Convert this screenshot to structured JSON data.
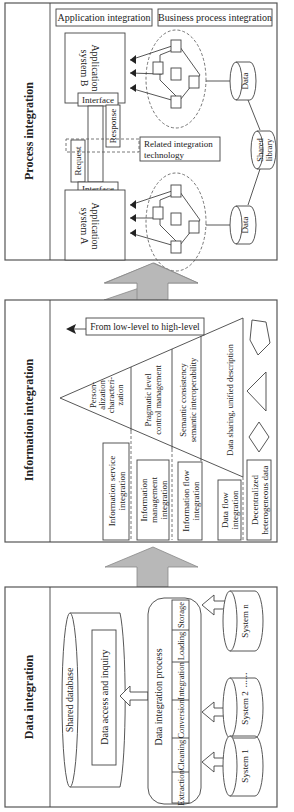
{
  "diagram": {
    "layers": [
      {
        "id": "process",
        "title": "Process integration",
        "header_boxes": [
          "Application integration",
          "Business process integration"
        ],
        "app_system_b": "Application system B",
        "app_system_a": "Application system A",
        "interface_top": "Interface",
        "interface_bottom": "Interface",
        "response": "Response",
        "request": "Request",
        "related_tech": "Related integration technology",
        "data_top": "Data",
        "data_bottom": "Data",
        "shared_library": "Shared library"
      },
      {
        "id": "information",
        "title": "Information integration",
        "direction_label": "From low-level to high-level",
        "pyramid_levels": [
          "Person-alization characteri-zation",
          "Pragmatic level control management",
          "Semantic consistency semantic interoperability",
          "Data sharing, unified description"
        ],
        "integration_boxes": [
          "Information service integration",
          "Information management integration",
          "Information flow integration",
          "Data flow integration",
          "Decentralized heterogeneous data"
        ],
        "shapes": [
          "pentagon",
          "triangle",
          "diamond"
        ]
      },
      {
        "id": "data",
        "title": "Data integration",
        "shared_database": "Shared database",
        "data_access": "Data access and inquiry",
        "process_title": "Data integration process",
        "process_steps": [
          "Extraction",
          "Cleaning",
          "Conversion",
          "Integration",
          "Loading",
          "Storage"
        ],
        "systems": [
          "System 1",
          "System 2",
          "System n"
        ],
        "ellipsis": "......"
      }
    ],
    "colors": {
      "arrow_fill": "#b8b8b8",
      "line": "#444444",
      "panel_border": "#555555"
    }
  }
}
